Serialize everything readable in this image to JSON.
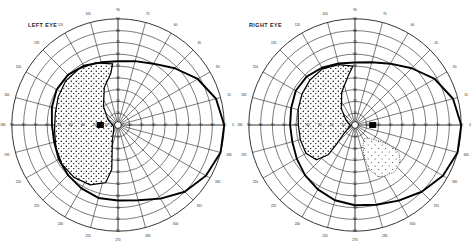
{
  "page": {
    "background_color": "#ffffff",
    "ink_color": "#000000"
  },
  "charts": [
    {
      "id": "left-eye",
      "label": "LEFT EYE",
      "label_position": "top-left"
    },
    {
      "id": "right-eye",
      "label": "RIGHT EYE",
      "label_position": "top-left"
    }
  ],
  "chart_data": {
    "type": "scatter",
    "subtitle": "Polar visual field plots for left and right eye",
    "xlabel": "Meridian (degrees)",
    "ylabel": "Eccentricity (degrees)",
    "grid": true,
    "legend_position": "none",
    "coordinate_system": "polar",
    "meridian_step_deg": 15,
    "meridian_labels": [
      0,
      15,
      30,
      45,
      60,
      75,
      90,
      105,
      120,
      135,
      150,
      165,
      180,
      195,
      210,
      225,
      240,
      255,
      270,
      285,
      300,
      315,
      330,
      345
    ],
    "eccentricity_rings_deg": [
      10,
      20,
      30,
      40,
      50,
      60,
      70,
      80,
      90
    ],
    "eccentricity_tick_labels": [
      "10",
      "20",
      "30",
      "40",
      "50",
      "60",
      "70",
      "80",
      "90"
    ],
    "rlim": [
      0,
      90
    ],
    "major_meridians_deg": [
      0,
      90,
      180,
      270
    ],
    "series": [
      {
        "name": "LEFT EYE",
        "chart_id": "left-eye",
        "eye": "OS",
        "fixation_point": {
          "r": 0,
          "theta": 0
        },
        "blind_spot": {
          "theta_deg": 180,
          "r_deg": 15,
          "width_deg": 6,
          "height_deg": 5
        },
        "isopter_outer": {
          "name": "outer isopter",
          "points_theta_r": [
            [
              0,
              90
            ],
            [
              15,
              86
            ],
            [
              30,
              78
            ],
            [
              45,
              68
            ],
            [
              60,
              60
            ],
            [
              75,
              56
            ],
            [
              90,
              54
            ],
            [
              105,
              55
            ],
            [
              120,
              58
            ],
            [
              135,
              60
            ],
            [
              150,
              60
            ],
            [
              165,
              58
            ],
            [
              180,
              56
            ],
            [
              195,
              56
            ],
            [
              210,
              58
            ],
            [
              225,
              60
            ],
            [
              240,
              62
            ],
            [
              255,
              64
            ],
            [
              270,
              64
            ],
            [
              285,
              66
            ],
            [
              300,
              72
            ],
            [
              315,
              80
            ],
            [
              330,
              86
            ],
            [
              345,
              90
            ]
          ]
        },
        "defect_region": {
          "name": "nasal-inferior dense scotoma",
          "shading": "dense-stipple",
          "points_theta_r": [
            [
              95,
              52
            ],
            [
              110,
              56
            ],
            [
              125,
              58
            ],
            [
              140,
              58
            ],
            [
              155,
              56
            ],
            [
              170,
              54
            ],
            [
              185,
              54
            ],
            [
              200,
              56
            ],
            [
              215,
              58
            ],
            [
              230,
              58
            ],
            [
              245,
              56
            ],
            [
              258,
              50
            ],
            [
              262,
              38
            ],
            [
              258,
              24
            ],
            [
              250,
              14
            ],
            [
              240,
              8
            ],
            [
              225,
              5
            ],
            [
              200,
              4
            ],
            [
              175,
              5
            ],
            [
              150,
              10
            ],
            [
              128,
              20
            ],
            [
              110,
              34
            ],
            [
              98,
              44
            ]
          ]
        }
      },
      {
        "name": "RIGHT EYE",
        "chart_id": "right-eye",
        "eye": "OD",
        "fixation_point": {
          "r": 0,
          "theta": 0
        },
        "blind_spot": {
          "theta_deg": 0,
          "r_deg": 15,
          "width_deg": 6,
          "height_deg": 5
        },
        "isopter_outer": {
          "name": "outer isopter",
          "points_theta_r": [
            [
              0,
              90
            ],
            [
              15,
              86
            ],
            [
              30,
              78
            ],
            [
              45,
              68
            ],
            [
              60,
              60
            ],
            [
              75,
              55
            ],
            [
              90,
              53
            ],
            [
              105,
              54
            ],
            [
              120,
              56
            ],
            [
              135,
              58
            ],
            [
              150,
              58
            ],
            [
              165,
              56
            ],
            [
              180,
              55
            ],
            [
              195,
              55
            ],
            [
              210,
              57
            ],
            [
              225,
              60
            ],
            [
              240,
              63
            ],
            [
              255,
              66
            ],
            [
              270,
              68
            ],
            [
              285,
              70
            ],
            [
              300,
              74
            ],
            [
              315,
              80
            ],
            [
              330,
              86
            ],
            [
              345,
              90
            ]
          ]
        },
        "defect_region": {
          "name": "nasal dense scotoma",
          "shading": "dense-stipple",
          "points_theta_r": [
            [
              92,
              50
            ],
            [
              105,
              53
            ],
            [
              120,
              55
            ],
            [
              135,
              54
            ],
            [
              150,
              52
            ],
            [
              165,
              50
            ],
            [
              180,
              48
            ],
            [
              195,
              48
            ],
            [
              210,
              48
            ],
            [
              222,
              44
            ],
            [
              228,
              34
            ],
            [
              226,
              22
            ],
            [
              218,
              12
            ],
            [
              205,
              6
            ],
            [
              190,
              4
            ],
            [
              172,
              5
            ],
            [
              150,
              9
            ],
            [
              130,
              18
            ],
            [
              112,
              30
            ],
            [
              98,
              42
            ]
          ]
        },
        "defect_region_secondary": {
          "name": "inferior-temporal faint scotoma",
          "shading": "light-stipple",
          "points_theta_r": [
            [
              300,
              50
            ],
            [
              310,
              52
            ],
            [
              320,
              50
            ],
            [
              328,
              44
            ],
            [
              330,
              34
            ],
            [
              326,
              24
            ],
            [
              316,
              16
            ],
            [
              304,
              14
            ],
            [
              292,
              18
            ],
            [
              286,
              28
            ],
            [
              288,
              40
            ],
            [
              294,
              48
            ]
          ]
        }
      }
    ]
  }
}
